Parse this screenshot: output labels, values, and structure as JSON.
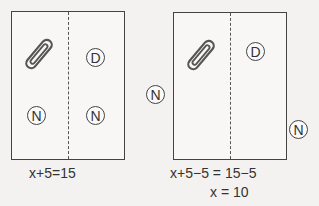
{
  "left_panel": {
    "coins": [
      {
        "label": "D",
        "side": "right",
        "position": "top"
      },
      {
        "label": "N",
        "side": "left",
        "position": "bottom"
      },
      {
        "label": "N",
        "side": "right",
        "position": "bottom"
      }
    ],
    "paperclip": "paperclip-icon",
    "equation": "x+5=15"
  },
  "right_panel": {
    "coins_inside": [
      {
        "label": "D",
        "side": "right",
        "position": "top"
      }
    ],
    "coins_outside": [
      {
        "label": "N",
        "position": "left-outside"
      },
      {
        "label": "N",
        "position": "right-outside"
      }
    ],
    "paperclip": "paperclip-icon",
    "equation_line1": "x+5−5 = 15−5",
    "equation_line2": "x = 10"
  }
}
